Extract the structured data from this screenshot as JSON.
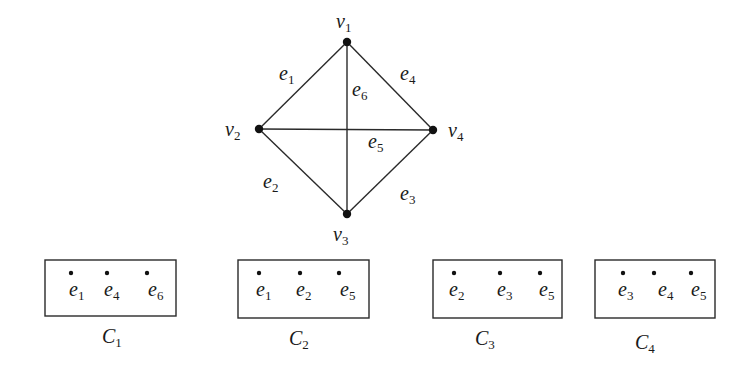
{
  "figure": {
    "type": "graph-with-cliques",
    "graph": {
      "vertices": [
        {
          "id": "v1",
          "label": "v",
          "sub": "1",
          "x": 347,
          "y": 42,
          "label_x": 336,
          "label_y": 28
        },
        {
          "id": "v2",
          "label": "v",
          "sub": "2",
          "x": 259,
          "y": 129,
          "label_x": 225,
          "label_y": 136
        },
        {
          "id": "v3",
          "label": "v",
          "sub": "3",
          "x": 347,
          "y": 214,
          "label_x": 333,
          "label_y": 241
        },
        {
          "id": "v4",
          "label": "v",
          "sub": "4",
          "x": 433,
          "y": 130,
          "label_x": 448,
          "label_y": 137
        }
      ],
      "edges": [
        {
          "id": "e1",
          "label": "e",
          "sub": "1",
          "from": "v1",
          "to": "v2",
          "label_x": 279,
          "label_y": 80
        },
        {
          "id": "e2",
          "label": "e",
          "sub": "2",
          "from": "v2",
          "to": "v3",
          "label_x": 263,
          "label_y": 188
        },
        {
          "id": "e3",
          "label": "e",
          "sub": "3",
          "from": "v3",
          "to": "v4",
          "label_x": 400,
          "label_y": 200
        },
        {
          "id": "e4",
          "label": "e",
          "sub": "4",
          "from": "v1",
          "to": "v4",
          "label_x": 400,
          "label_y": 80
        },
        {
          "id": "e5",
          "label": "e",
          "sub": "5",
          "from": "v2",
          "to": "v4",
          "label_x": 368,
          "label_y": 148
        },
        {
          "id": "e6",
          "label": "e",
          "sub": "6",
          "from": "v1",
          "to": "v3",
          "label_x": 352,
          "label_y": 96
        }
      ]
    },
    "cliques": [
      {
        "id": "C1",
        "label": "C",
        "sub": "1",
        "box": {
          "x": 45,
          "y": 260,
          "w": 131,
          "h": 56
        },
        "caption_x": 102,
        "caption_y": 343,
        "members": [
          {
            "label": "e",
            "sub": "1",
            "dot_x": 71,
            "text_x": 69
          },
          {
            "label": "e",
            "sub": "4",
            "dot_x": 107,
            "text_x": 104
          },
          {
            "label": "e",
            "sub": "6",
            "dot_x": 147,
            "text_x": 148
          }
        ]
      },
      {
        "id": "C2",
        "label": "C",
        "sub": "2",
        "box": {
          "x": 238,
          "y": 260,
          "w": 131,
          "h": 58
        },
        "caption_x": 289,
        "caption_y": 345,
        "members": [
          {
            "label": "e",
            "sub": "1",
            "dot_x": 259,
            "text_x": 256
          },
          {
            "label": "e",
            "sub": "2",
            "dot_x": 300,
            "text_x": 296
          },
          {
            "label": "e",
            "sub": "5",
            "dot_x": 339,
            "text_x": 340
          }
        ]
      },
      {
        "id": "C3",
        "label": "C",
        "sub": "3",
        "box": {
          "x": 433,
          "y": 260,
          "w": 129,
          "h": 58
        },
        "caption_x": 475,
        "caption_y": 345,
        "members": [
          {
            "label": "e",
            "sub": "2",
            "dot_x": 454,
            "text_x": 449
          },
          {
            "label": "e",
            "sub": "3",
            "dot_x": 500,
            "text_x": 497
          },
          {
            "label": "e",
            "sub": "5",
            "dot_x": 540,
            "text_x": 539
          }
        ]
      },
      {
        "id": "C4",
        "label": "C",
        "sub": "4",
        "box": {
          "x": 595,
          "y": 260,
          "w": 120,
          "h": 58
        },
        "caption_x": 635,
        "caption_y": 349,
        "members": [
          {
            "label": "e",
            "sub": "3",
            "dot_x": 623,
            "text_x": 618
          },
          {
            "label": "e",
            "sub": "4",
            "dot_x": 654,
            "text_x": 658
          },
          {
            "label": "e",
            "sub": "5",
            "dot_x": 691,
            "text_x": 691
          }
        ]
      }
    ]
  },
  "colors": {
    "ink": "#1a1a1a",
    "background": "#ffffff",
    "bleed_through": "#e4e4e4"
  }
}
